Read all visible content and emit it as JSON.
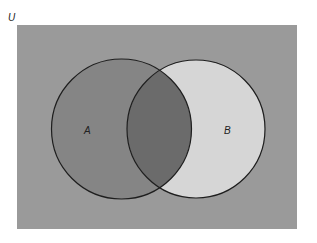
{
  "diagram": {
    "type": "venn",
    "universe_label": "U",
    "sets": [
      {
        "label": "A",
        "fill": "#858585"
      },
      {
        "label": "B",
        "fill": "#d6d6d6"
      }
    ],
    "intersection_fill": "#6b6b6b",
    "universe_fill": "#9a9a9a",
    "outline_color": "#1e1e1e"
  }
}
